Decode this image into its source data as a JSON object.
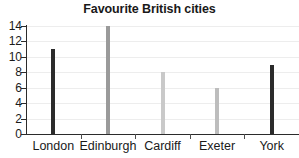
{
  "chart_data": {
    "type": "bar",
    "title": "Favourite British cities",
    "xlabel": "",
    "ylabel": "",
    "categories": [
      "London",
      "Edinburgh",
      "Cardiff",
      "Exeter",
      "York"
    ],
    "values": [
      11,
      14,
      8,
      6,
      9
    ],
    "series": [
      {
        "name": "Number of votes",
        "values": [
          11,
          14,
          8,
          6,
          9
        ]
      }
    ],
    "bar_colors": [
      "#2b2b2b",
      "#9a9a9a",
      "#c9c9c9",
      "#bdbdbd",
      "#2b2b2b"
    ],
    "ylim": [
      0,
      14
    ],
    "ytick_values": [
      0,
      2,
      4,
      6,
      8,
      10,
      12,
      14
    ],
    "ytick_labels": [
      "0",
      "2",
      "4",
      "6",
      "8",
      "10",
      "12",
      "14"
    ],
    "grid": true,
    "grid_color": "#ededed",
    "legend": null,
    "legend_position": "none",
    "axis_color": "#2b2b2b",
    "background": "#ffffff",
    "title_color": "#191919"
  }
}
